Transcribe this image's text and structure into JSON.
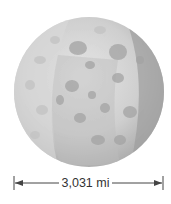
{
  "figure": {
    "diameter_label": "3,031 mi"
  }
}
